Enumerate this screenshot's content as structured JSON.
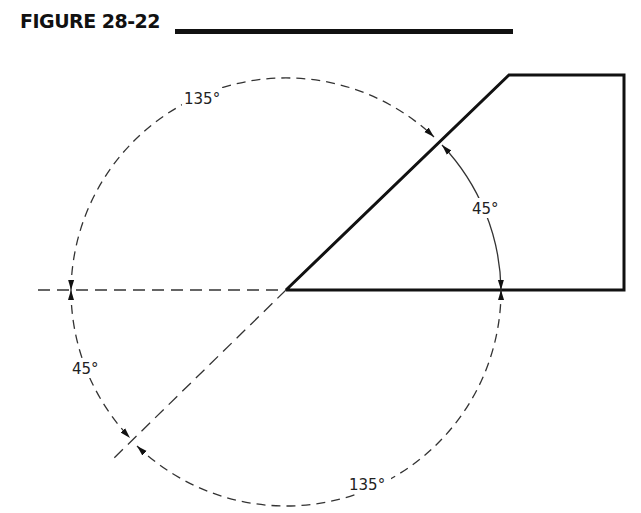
{
  "figure": {
    "title": "FIGURE 28-22"
  },
  "diagram": {
    "labels": {
      "upper_arc": "135°",
      "right_arc": "45°",
      "left_arc": "45°",
      "lower_arc": "135°"
    },
    "colors": {
      "line": "#111111",
      "dash": "#333333",
      "text": "#222222"
    }
  }
}
